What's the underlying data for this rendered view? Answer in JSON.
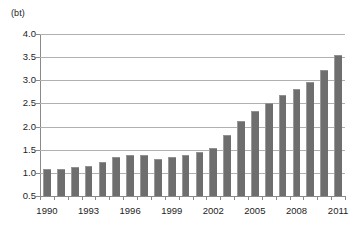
{
  "chart_data": {
    "type": "bar",
    "title": "",
    "subtitle": "",
    "xlabel": "",
    "ylabel": "",
    "unit_label": "(bt)",
    "ylim": [
      0.5,
      4.0
    ],
    "y_ticks": [
      "4.0",
      "3.5",
      "3.0",
      "2.5",
      "2.0",
      "1.5",
      "1.0",
      "0.5"
    ],
    "y_tick_values": [
      4.0,
      3.5,
      3.0,
      2.5,
      2.0,
      1.5,
      1.0,
      0.5
    ],
    "grid": true,
    "legend": "none",
    "x_tick_labels": [
      "1990",
      "1993",
      "1996",
      "1999",
      "2002",
      "2005",
      "2008",
      "2011"
    ],
    "categories": [
      "1990",
      "1991",
      "1992",
      "1993",
      "1994",
      "1995",
      "1996",
      "1997",
      "1998",
      "1999",
      "2000",
      "2001",
      "2002",
      "2003",
      "2004",
      "2005",
      "2006",
      "2007",
      "2008",
      "2009",
      "2010",
      "2011"
    ],
    "values": [
      1.09,
      1.09,
      1.12,
      1.15,
      1.24,
      1.35,
      1.38,
      1.38,
      1.31,
      1.35,
      1.39,
      1.46,
      1.53,
      1.82,
      2.11,
      2.33,
      2.5,
      2.68,
      2.81,
      2.96,
      3.23,
      3.54
    ],
    "series": [
      {
        "name": "value",
        "values": [
          1.09,
          1.09,
          1.12,
          1.15,
          1.24,
          1.35,
          1.38,
          1.38,
          1.31,
          1.35,
          1.39,
          1.46,
          1.53,
          1.82,
          2.11,
          2.33,
          2.5,
          2.68,
          2.81,
          2.96,
          3.23,
          3.54
        ]
      }
    ],
    "colors": {
      "bar": "#6e6e6e",
      "bar_highlight": "#9a9a9a",
      "gridline": "#b0b0b0",
      "axis": "#8a8a8a",
      "text": "#1d1d1d",
      "background": "#ffffff"
    }
  }
}
